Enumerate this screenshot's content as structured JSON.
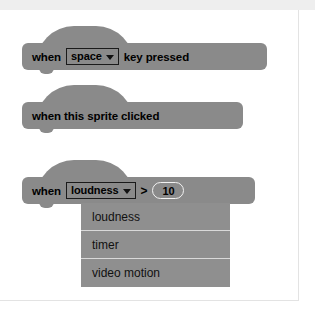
{
  "page": {
    "background_color": "#ffffff",
    "top_band_color": "#eeeeee",
    "border_color": "#e3e3e3"
  },
  "palette": {
    "block_gray": "#8a8a8a",
    "menu_gray": "#8f8f8f",
    "field_border": "#1a1a1a",
    "oval_border": "#f2f2f2",
    "text_color": "#000000",
    "separator": "#d9d9d9"
  },
  "blocks": [
    {
      "id": "when-key-pressed",
      "type": "hat",
      "parts": {
        "prefix": "when",
        "dropdown_value": "space",
        "dropdown_icon": "chevron-down-icon",
        "suffix": "key pressed"
      }
    },
    {
      "id": "when-this-sprite-clicked",
      "type": "hat",
      "parts": {
        "label": "when this sprite clicked"
      }
    },
    {
      "id": "when-greater-than",
      "type": "hat",
      "parts": {
        "prefix": "when",
        "dropdown_value": "loudness",
        "dropdown_icon": "chevron-down-icon",
        "operator": ">",
        "number_value": "10"
      }
    }
  ],
  "dropdown_menu": {
    "open": true,
    "owner_block": "when-greater-than",
    "items": [
      {
        "label": "loudness"
      },
      {
        "label": "timer"
      },
      {
        "label": "video motion"
      }
    ]
  }
}
